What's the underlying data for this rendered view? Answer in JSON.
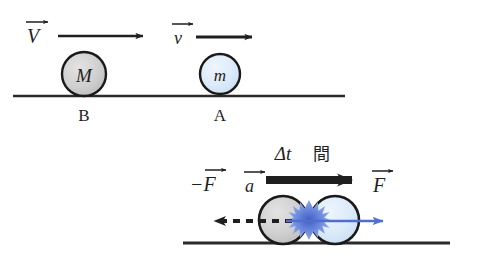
{
  "figure": {
    "title_hidden": "",
    "scenes": [
      {
        "id": "before-collision",
        "balls": [
          {
            "name": "ball-M",
            "mass_label": "M",
            "name_label": "B",
            "fill": "#cfcfcf",
            "cx": 84,
            "cy": 74,
            "r": 22
          },
          {
            "name": "ball-m",
            "mass_label": "m",
            "name_label": "A",
            "fill": "#dbe8f7",
            "cx": 220,
            "cy": 74,
            "r": 20
          }
        ],
        "vectors": [
          {
            "name": "velocity-V",
            "label": "V",
            "direction": "right",
            "color": "#1f1f1f"
          },
          {
            "name": "velocity-v",
            "label": "v",
            "direction": "right",
            "color": "#1f1f1f"
          }
        ],
        "ground": {
          "x1": 13,
          "x2": 345,
          "y": 96,
          "color": "#2b2b2b"
        }
      },
      {
        "id": "during-collision",
        "duration_label": "Δt",
        "duration_suffix": "間",
        "balls": [
          {
            "name": "ball-M-collide",
            "fill": "#d2d2d2",
            "cx": 283,
            "cy": 220,
            "r": 24
          },
          {
            "name": "ball-m-collide",
            "fill": "#dbe8f7",
            "cx": 335,
            "cy": 220,
            "r": 24
          }
        ],
        "impact": {
          "name": "impact-starburst",
          "cx": 309,
          "cy": 220,
          "color": "#5f7fd6"
        },
        "vectors": [
          {
            "name": "force-negative-F",
            "label": "−F",
            "direction": "left",
            "color": "#1f1f1f",
            "style": "dashed"
          },
          {
            "name": "acceleration-a",
            "label": "a",
            "direction": "right",
            "color": "#1f1f1f",
            "style": "thick"
          },
          {
            "name": "force-F",
            "label": "F",
            "direction": "right",
            "color": "#4f6fd0",
            "style": "solid"
          }
        ],
        "ground": {
          "x1": 183,
          "x2": 450,
          "y": 243,
          "color": "#2b2b2b"
        }
      }
    ],
    "colors": {
      "gray_ball": "#cfcfcf",
      "blue_ball": "#dbe8f7",
      "blue_accent": "#4f6fd0",
      "impact_blue": "#5f7fd6",
      "ink": "#1f1f1f",
      "ground": "#2b2b2b",
      "background": "#ffffff"
    }
  }
}
